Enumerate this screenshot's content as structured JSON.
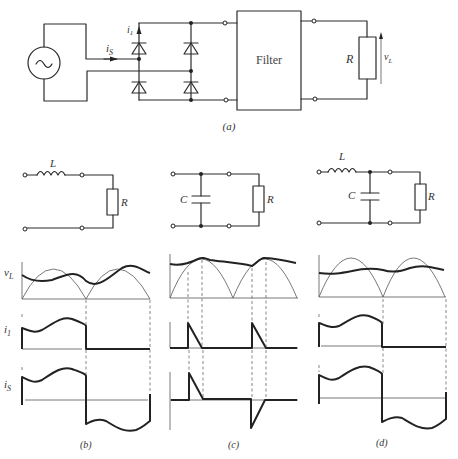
{
  "figure": {
    "panel_a": {
      "caption": "(a)",
      "filter_label": "Filter",
      "resistor_label": "R",
      "current_source_label": "i",
      "current_source_sub": "S",
      "current_diode_label": "i",
      "current_diode_sub": "1",
      "voltage_label": "v",
      "voltage_sub": "L",
      "source_symbol": "~"
    },
    "filters": {
      "b": {
        "inductor_label": "L",
        "resistor_label": "R"
      },
      "c": {
        "capacitor_label": "C",
        "resistor_label": "R"
      },
      "d": {
        "inductor_label": "L",
        "capacitor_label": "C",
        "resistor_label": "R"
      }
    },
    "waveforms": {
      "row_labels": {
        "vL": {
          "main": "v",
          "sub": "L"
        },
        "i1": {
          "main": "i",
          "sub": "1"
        },
        "iS": {
          "main": "i",
          "sub": "S"
        }
      },
      "captions": {
        "b": "(b)",
        "c": "(c)",
        "d": "(d)"
      }
    }
  }
}
